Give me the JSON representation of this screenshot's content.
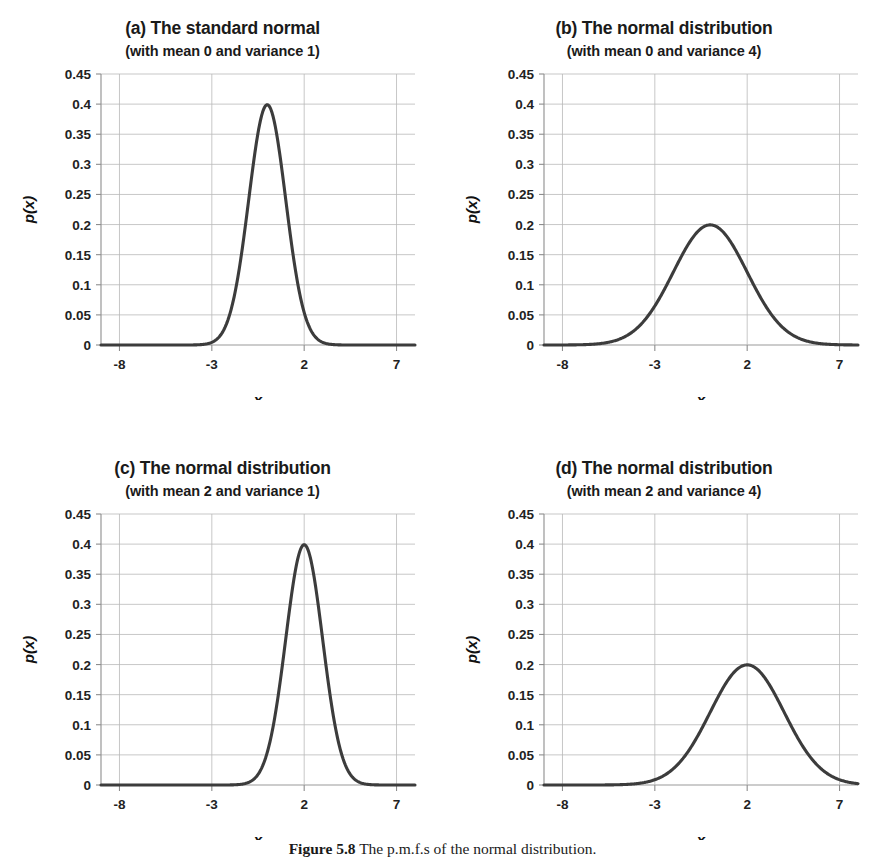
{
  "figure": {
    "caption_label": "Figure 5.8",
    "caption_text": "The p.m.f.s of the normal distribution.",
    "background_color": "#ffffff",
    "curve_color": "#3c3c3c",
    "grid_color": "#b9b9b9",
    "axis_color": "#8d8d8d"
  },
  "axes_common": {
    "xlabel": "x",
    "ylabel": "p(x)",
    "xticks": [
      "-8",
      "-3",
      "2",
      "7"
    ],
    "xtick_values": [
      -8,
      -3,
      2,
      7
    ],
    "yticks": [
      "0",
      "0.05",
      "0.1",
      "0.15",
      "0.2",
      "0.25",
      "0.3",
      "0.35",
      "0.4",
      "0.45"
    ],
    "ytick_values": [
      0,
      0.05,
      0.1,
      0.15,
      0.2,
      0.25,
      0.3,
      0.35,
      0.4,
      0.45
    ],
    "xlim": [
      -9,
      8
    ],
    "ylim": [
      0,
      0.45
    ],
    "grid": "horizontal-and-vertical"
  },
  "panels": [
    {
      "id": "a",
      "title": "(a) The standard normal",
      "subtitle": "(with mean 0 and variance 1)",
      "mean": 0,
      "variance": 1,
      "peak": 0.4
    },
    {
      "id": "b",
      "title": "(b) The normal distribution",
      "subtitle": "(with mean 0 and variance 4)",
      "mean": 0,
      "variance": 4,
      "peak": 0.2
    },
    {
      "id": "c",
      "title": "(c) The normal distribution",
      "subtitle": "(with mean 2 and variance 1)",
      "mean": 2,
      "variance": 1,
      "peak": 0.4
    },
    {
      "id": "d",
      "title": "(d) The normal distribution",
      "subtitle": "(with mean 2 and variance 4)",
      "mean": 2,
      "variance": 4,
      "peak": 0.2
    }
  ],
  "chart_data": {
    "type": "line",
    "title": "The p.m.f.s of the normal distribution.",
    "xlabel": "x",
    "ylabel": "p(x)",
    "xlim": [
      -9,
      8
    ],
    "ylim": [
      0,
      0.45
    ],
    "xticks": [
      -8,
      -3,
      2,
      7
    ],
    "yticks": [
      0,
      0.05,
      0.1,
      0.15,
      0.2,
      0.25,
      0.3,
      0.35,
      0.4,
      0.45
    ],
    "grid": true,
    "legend": "none",
    "x": [
      -9,
      -8,
      -7,
      -6,
      -5,
      -4,
      -3,
      -2,
      -1,
      0,
      1,
      2,
      3,
      4,
      5,
      6,
      7,
      8
    ],
    "series": [
      {
        "name": "(a) mean 0, variance 1",
        "mean": 0,
        "variance": 4,
        "sigma": 1,
        "peak": 0.3989,
        "values": [
          0.0,
          0.0,
          0.0,
          0.0,
          0.0,
          0.0001,
          0.0044,
          0.054,
          0.242,
          0.3989,
          0.242,
          0.054,
          0.0044,
          0.0001,
          0.0,
          0.0,
          0.0,
          0.0
        ]
      },
      {
        "name": "(b) mean 0, variance 4",
        "mean": 0,
        "variance": 4,
        "sigma": 2,
        "peak": 0.1995,
        "values": [
          0.0003,
          0.0007,
          0.0022,
          0.0065,
          0.0162,
          0.027,
          0.0648,
          0.121,
          0.176,
          0.1995,
          0.176,
          0.121,
          0.0648,
          0.027,
          0.0162,
          0.0065,
          0.0022,
          0.0007
        ]
      },
      {
        "name": "(c) mean 2, variance 1",
        "mean": 2,
        "variance": 1,
        "sigma": 1,
        "peak": 0.3989,
        "values": [
          0.0,
          0.0,
          0.0,
          0.0,
          0.0,
          0.0,
          0.0,
          0.0001,
          0.0044,
          0.054,
          0.242,
          0.3989,
          0.242,
          0.054,
          0.0044,
          0.0001,
          0.0,
          0.0
        ]
      },
      {
        "name": "(d) mean 2, variance 4",
        "mean": 2,
        "variance": 4,
        "sigma": 2,
        "peak": 0.1995,
        "values": [
          0.0,
          0.0002,
          0.0004,
          0.0013,
          0.0044,
          0.0108,
          0.0228,
          0.044,
          0.0648,
          0.121,
          0.176,
          0.1995,
          0.176,
          0.121,
          0.0648,
          0.044,
          0.0228,
          0.0108
        ]
      }
    ]
  }
}
